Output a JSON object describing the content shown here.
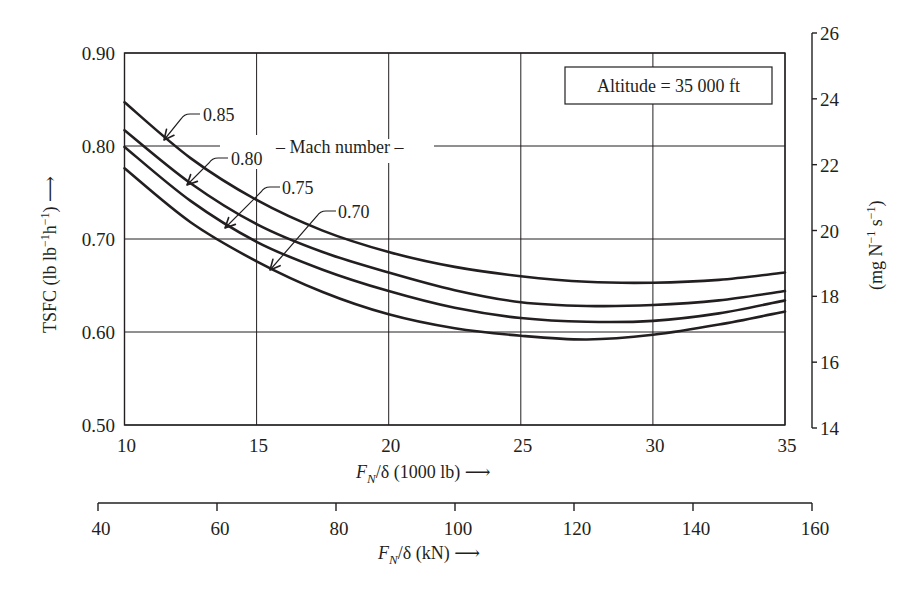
{
  "chart_data": {
    "type": "line",
    "title": "",
    "xlabel": "F_N/δ (1000 lb) →",
    "ylabel": "TSFC (lb lb⁻¹h⁻¹) →",
    "ylabel_right": "(mg N⁻¹ s⁻¹)",
    "xlabel_secondary": "F_N/δ (kN) →",
    "xlim": [
      10,
      35
    ],
    "ylim": [
      0.5,
      0.9
    ],
    "ylim_right": [
      14,
      26
    ],
    "xlim_secondary": [
      40,
      160
    ],
    "x_ticks": [
      "10",
      "15",
      "20",
      "25",
      "30",
      "35"
    ],
    "y_ticks": [
      "0.50",
      "0.60",
      "0.70",
      "0.80",
      "0.90"
    ],
    "y_right_ticks": [
      "14",
      "16",
      "18",
      "20",
      "22",
      "24",
      "26"
    ],
    "x_secondary_ticks": [
      "40",
      "60",
      "80",
      "100",
      "120",
      "140",
      "160"
    ],
    "grid": true,
    "legend_title": "Mach number",
    "annotation_box": "Altitude = 35 000 ft",
    "x": [
      10,
      12.5,
      15,
      17.5,
      20,
      22.5,
      25,
      27.5,
      30,
      32.5,
      35
    ],
    "series": [
      {
        "name": "0.85",
        "values": [
          0.847,
          0.787,
          0.742,
          0.709,
          0.686,
          0.67,
          0.66,
          0.654,
          0.653,
          0.656,
          0.664
        ]
      },
      {
        "name": "0.80",
        "values": [
          0.817,
          0.76,
          0.716,
          0.686,
          0.664,
          0.645,
          0.632,
          0.628,
          0.629,
          0.634,
          0.644
        ]
      },
      {
        "name": "0.75",
        "values": [
          0.799,
          0.741,
          0.697,
          0.667,
          0.644,
          0.626,
          0.615,
          0.611,
          0.612,
          0.62,
          0.634
        ]
      },
      {
        "name": "0.70",
        "values": [
          0.776,
          0.718,
          0.676,
          0.643,
          0.619,
          0.604,
          0.596,
          0.592,
          0.597,
          0.608,
          0.622
        ]
      }
    ]
  },
  "labels": {
    "y_left_title": "TSFC (lb lb",
    "y_left_sup1": "−1",
    "y_left_mid": "h",
    "y_left_sup2": "−1",
    "y_left_end": ") ⟶",
    "y_right_open": "(mg N",
    "y_right_sup1": "−1",
    "y_right_mid": " s",
    "y_right_sup2": "−1",
    "y_right_close": ")",
    "x_var": "F",
    "x_sub": "N",
    "x_primary_unit": "/δ (1000 lb) ⟶",
    "x_secondary_unit": "/δ (kN) ⟶",
    "mach_label": "– Mach number –",
    "altitude": "Altitude = 35 000 ft",
    "series_labels": [
      "0.85",
      "0.80",
      "0.75",
      "0.70"
    ]
  }
}
